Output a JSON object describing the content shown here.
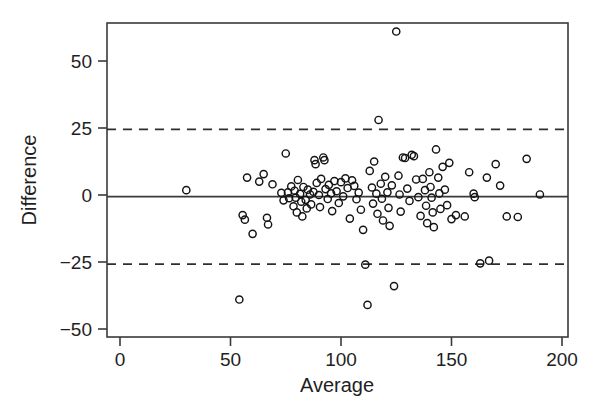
{
  "figure": {
    "background": "#ffffff",
    "ink_color": "#1f1f1f",
    "width": 601,
    "height": 419
  },
  "axes": {
    "x_title": "Average",
    "y_title": "Difference",
    "x_ticks": [
      "0",
      "50",
      "100",
      "150",
      "200"
    ],
    "y_ticks": [
      "50",
      "25",
      "0",
      "−25",
      "−50"
    ]
  },
  "chart_data": {
    "type": "scatter",
    "title": "",
    "subtitle": "",
    "xlabel": "Average",
    "ylabel": "Difference",
    "xlim": [
      0,
      207
    ],
    "ylim": [
      -57,
      66
    ],
    "x_ticks": [
      0,
      50,
      100,
      150,
      200
    ],
    "y_ticks": [
      50,
      25,
      0,
      -25,
      -50
    ],
    "grid": false,
    "legend": null,
    "legend_position": "none",
    "marker": {
      "shape": "open-circle",
      "radius_px": 3.6,
      "fill": "none",
      "stroke": "#141414",
      "stroke_width": 1.45
    },
    "annotations": [
      {
        "name": "mean-difference-line",
        "style": "solid",
        "orientation": "horizontal",
        "y": -0.6,
        "label": "mean difference (bias)"
      },
      {
        "name": "upper-limit-of-agreement",
        "style": "dashed",
        "orientation": "horizontal",
        "y": 24.5,
        "label": "upper limit of agreement"
      },
      {
        "name": "lower-limit-of-agreement",
        "style": "dashed",
        "orientation": "horizontal",
        "y": -25.8,
        "label": "lower limit of agreement"
      }
    ],
    "series": [
      {
        "name": "paired measurements",
        "points": [
          [
            30.0,
            1.8
          ],
          [
            54.0,
            -39.0
          ],
          [
            55.5,
            -7.5
          ],
          [
            56.5,
            -9.2
          ],
          [
            57.5,
            6.5
          ],
          [
            60.0,
            -14.5
          ],
          [
            63.0,
            5.0
          ],
          [
            65.0,
            7.8
          ],
          [
            66.5,
            -8.5
          ],
          [
            67.0,
            -11.0
          ],
          [
            69.0,
            4.0
          ],
          [
            73.0,
            0.8
          ],
          [
            74.0,
            -2.0
          ],
          [
            75.0,
            15.5
          ],
          [
            76.0,
            1.0
          ],
          [
            76.5,
            -1.2
          ],
          [
            77.5,
            3.2
          ],
          [
            78.5,
            -4.2
          ],
          [
            79.0,
            1.6
          ],
          [
            79.5,
            -1.0
          ],
          [
            80.0,
            -6.5
          ],
          [
            80.5,
            5.6
          ],
          [
            81.5,
            0.4
          ],
          [
            82.0,
            -2.5
          ],
          [
            82.5,
            -8.0
          ],
          [
            83.0,
            3.0
          ],
          [
            84.0,
            -1.8
          ],
          [
            84.5,
            -5.0
          ],
          [
            85.0,
            2.0
          ],
          [
            86.0,
            0.2
          ],
          [
            86.5,
            -3.5
          ],
          [
            87.5,
            1.2
          ],
          [
            88.0,
            13.0
          ],
          [
            88.5,
            11.5
          ],
          [
            89.0,
            4.5
          ],
          [
            90.0,
            0.0
          ],
          [
            90.5,
            -4.5
          ],
          [
            91.0,
            6.0
          ],
          [
            92.0,
            14.0
          ],
          [
            92.5,
            13.0
          ],
          [
            93.0,
            2.2
          ],
          [
            94.0,
            -1.5
          ],
          [
            94.5,
            3.8
          ],
          [
            95.5,
            0.6
          ],
          [
            96.0,
            -6.0
          ],
          [
            97.0,
            5.2
          ],
          [
            98.0,
            1.4
          ],
          [
            99.0,
            -3.0
          ],
          [
            100.0,
            4.8
          ],
          [
            101.0,
            -0.5
          ],
          [
            102.0,
            6.2
          ],
          [
            103.0,
            2.6
          ],
          [
            104.0,
            -8.8
          ],
          [
            105.0,
            5.5
          ],
          [
            106.0,
            3.4
          ],
          [
            107.0,
            -1.6
          ],
          [
            108.0,
            0.9
          ],
          [
            109.0,
            -5.5
          ],
          [
            110.0,
            -13.0
          ],
          [
            111.0,
            -26.0
          ],
          [
            112.0,
            -41.0
          ],
          [
            113.0,
            9.0
          ],
          [
            114.0,
            2.8
          ],
          [
            114.5,
            -3.2
          ],
          [
            115.0,
            12.5
          ],
          [
            116.0,
            0.5
          ],
          [
            116.5,
            -7.0
          ],
          [
            117.0,
            28.0
          ],
          [
            118.0,
            4.2
          ],
          [
            118.5,
            -1.4
          ],
          [
            119.0,
            -9.5
          ],
          [
            120.0,
            6.8
          ],
          [
            121.0,
            1.0
          ],
          [
            121.5,
            -4.8
          ],
          [
            122.0,
            -11.5
          ],
          [
            123.0,
            3.6
          ],
          [
            124.0,
            -34.0
          ],
          [
            125.0,
            61.0
          ],
          [
            126.0,
            7.2
          ],
          [
            126.5,
            0.2
          ],
          [
            127.0,
            -6.2
          ],
          [
            128.0,
            14.0
          ],
          [
            129.0,
            13.8
          ],
          [
            130.0,
            2.4
          ],
          [
            131.0,
            -2.2
          ],
          [
            132.0,
            15.0
          ],
          [
            133.0,
            14.5
          ],
          [
            134.0,
            5.8
          ],
          [
            135.0,
            -0.8
          ],
          [
            136.0,
            -7.8
          ],
          [
            137.0,
            6.0
          ],
          [
            138.0,
            1.8
          ],
          [
            138.5,
            -4.0
          ],
          [
            139.0,
            -10.5
          ],
          [
            140.0,
            8.5
          ],
          [
            140.5,
            3.0
          ],
          [
            141.0,
            -1.0
          ],
          [
            141.5,
            -6.5
          ],
          [
            142.0,
            -12.0
          ],
          [
            143.0,
            17.0
          ],
          [
            144.0,
            6.5
          ],
          [
            144.5,
            0.6
          ],
          [
            145.0,
            -5.2
          ],
          [
            146.0,
            10.5
          ],
          [
            147.0,
            2.0
          ],
          [
            148.0,
            -3.8
          ],
          [
            149.0,
            12.0
          ],
          [
            150.0,
            -9.0
          ],
          [
            152.0,
            -7.5
          ],
          [
            156.0,
            -8.0
          ],
          [
            158.0,
            8.5
          ],
          [
            160.0,
            0.5
          ],
          [
            160.5,
            -0.8
          ],
          [
            163.0,
            -25.5
          ],
          [
            166.0,
            6.5
          ],
          [
            167.0,
            -24.5
          ],
          [
            170.0,
            11.5
          ],
          [
            172.0,
            3.5
          ],
          [
            175.0,
            -8.0
          ],
          [
            180.0,
            -8.2
          ],
          [
            184.0,
            13.5
          ],
          [
            190.0,
            0.2
          ]
        ]
      }
    ]
  }
}
